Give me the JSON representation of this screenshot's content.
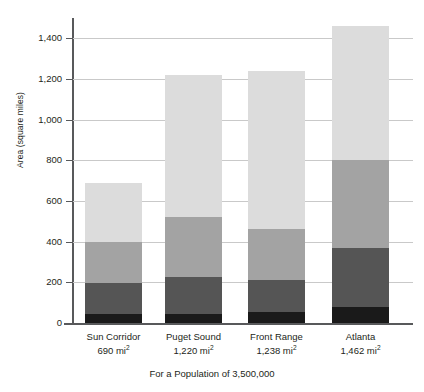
{
  "chart_data": {
    "type": "bar",
    "subtype": "stacked-bar",
    "title": "",
    "xlabel": "For a Population of 3,500,000",
    "ylabel": "Area (square miles)",
    "ylim": [
      0,
      1500
    ],
    "grid": true,
    "legend_position": "none",
    "y_ticks": [
      0,
      200,
      400,
      600,
      800,
      1000,
      1200,
      1400
    ],
    "y_tick_labels": [
      "0",
      "200",
      "400",
      "600",
      "800",
      "1,000",
      "1,200",
      "1,400"
    ],
    "categories": [
      "Sun Corridor",
      "Puget Sound",
      "Front Range",
      "Atlanta"
    ],
    "category_values": [
      "690 mi",
      "1,220 mi",
      "1,238 mi",
      "1,462 mi"
    ],
    "category_unit_exponent": "2",
    "category_totals": [
      690,
      1220,
      1238,
      1462
    ],
    "series": [
      {
        "name": "segment-1-black",
        "color": "#1a1a1a",
        "values": [
          45,
          45,
          55,
          80
        ]
      },
      {
        "name": "segment-2-dark-gray",
        "color": "#555555",
        "values": [
          150,
          180,
          157,
          290
        ]
      },
      {
        "name": "segment-3-medium-gray",
        "color": "#a3a3a3",
        "values": [
          205,
          295,
          250,
          430
        ]
      },
      {
        "name": "segment-4-light-gray",
        "color": "#dcdcdc",
        "values": [
          290,
          700,
          776,
          662
        ]
      }
    ],
    "cumulative_boundaries": {
      "Sun Corridor": [
        45,
        195,
        400,
        690
      ],
      "Puget Sound": [
        45,
        225,
        520,
        1220
      ],
      "Front Range": [
        55,
        212,
        462,
        1238
      ],
      "Atlanta": [
        80,
        370,
        800,
        1462
      ]
    }
  },
  "axis": {
    "y_title": "Area (square miles)"
  },
  "footnote": {
    "text": "For a Population of 3,500,000"
  },
  "colors": {
    "gridline": "#c9c9c9",
    "axis": "#58595b",
    "text": "#231f20",
    "background": "#ffffff"
  }
}
